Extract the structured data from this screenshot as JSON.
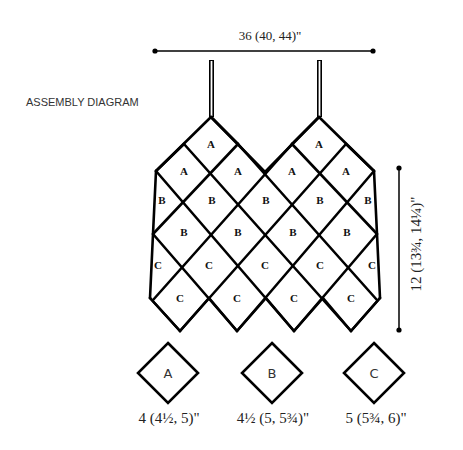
{
  "title": "ASSEMBLY DIAGRAM",
  "dimensions": {
    "width_label": "36 (40, 44)\"",
    "height_label": "12 (13¾, 14¼)\""
  },
  "grid": {
    "rows": [
      {
        "label": "A",
        "cells": [
          {
            "x": 211,
            "y": 144
          },
          {
            "x": 319,
            "y": 144
          }
        ]
      },
      {
        "label": "A",
        "cells": [
          {
            "x": 184,
            "y": 171
          },
          {
            "x": 238,
            "y": 171
          },
          {
            "x": 292,
            "y": 171
          },
          {
            "x": 346,
            "y": 171
          }
        ]
      },
      {
        "label": "B",
        "cells": [
          {
            "x": 162,
            "y": 200
          },
          {
            "x": 212,
            "y": 200
          },
          {
            "x": 266,
            "y": 200
          },
          {
            "x": 320,
            "y": 200
          },
          {
            "x": 368,
            "y": 200
          }
        ]
      },
      {
        "label": "B",
        "cells": [
          {
            "x": 184,
            "y": 232
          },
          {
            "x": 238,
            "y": 232
          },
          {
            "x": 293,
            "y": 232
          },
          {
            "x": 347,
            "y": 232
          }
        ]
      },
      {
        "label": "C",
        "cells": [
          {
            "x": 158,
            "y": 265
          },
          {
            "x": 209,
            "y": 265
          },
          {
            "x": 265,
            "y": 265
          },
          {
            "x": 320,
            "y": 265
          },
          {
            "x": 372,
            "y": 265
          }
        ]
      },
      {
        "label": "C",
        "cells": [
          {
            "x": 180,
            "y": 298
          },
          {
            "x": 237,
            "y": 298
          },
          {
            "x": 294,
            "y": 298
          },
          {
            "x": 351,
            "y": 298
          }
        ]
      }
    ]
  },
  "key": [
    {
      "letter": "A",
      "size": "4 (4½, 5)\"",
      "cx": 168
    },
    {
      "letter": "B",
      "size": "4½ (5, 5¾)\"",
      "cx": 272
    },
    {
      "letter": "C",
      "size": "5 (5¾, 6)\"",
      "cx": 374
    }
  ],
  "colors": {
    "line": "#000000",
    "text": "#222222",
    "background": "#ffffff"
  }
}
